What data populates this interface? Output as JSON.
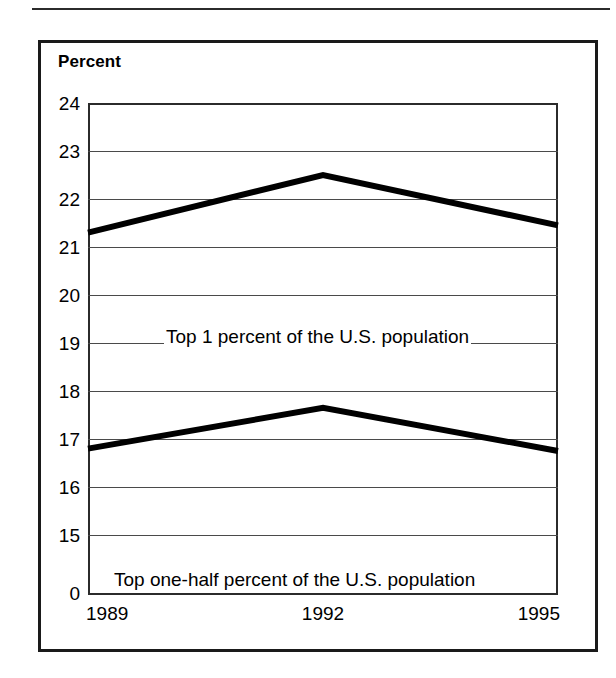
{
  "figure": {
    "axis_title": "Percent"
  },
  "chart_data": {
    "type": "line",
    "title": "Percent",
    "xlabel": "",
    "ylabel": "Percent",
    "x": [
      1989,
      1992,
      1995
    ],
    "xtick_labels": [
      "1989",
      "1992",
      "1995"
    ],
    "ytick_labels": [
      "24",
      "23",
      "22",
      "21",
      "20",
      "19",
      "18",
      "17",
      "16",
      "15",
      "0"
    ],
    "ytick_values": [
      24,
      23,
      22,
      21,
      20,
      19,
      18,
      17,
      16,
      15,
      0
    ],
    "ylim": [
      15,
      24
    ],
    "y_axis_break": true,
    "grid": true,
    "legend": "inline-annotations",
    "series": [
      {
        "name": "Top 1 percent of the U.S. population",
        "annotation": "Top 1 percent of the U.S. population",
        "values": [
          21.3,
          22.5,
          21.45
        ],
        "color": "#000000"
      },
      {
        "name": "Top one-half percent of the U.S. population",
        "annotation": "Top one-half percent of the U.S. population",
        "values": [
          16.8,
          17.65,
          16.75
        ],
        "color": "#000000"
      }
    ]
  }
}
